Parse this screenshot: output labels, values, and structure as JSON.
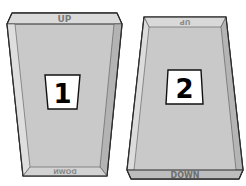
{
  "figure": {
    "colors": {
      "face": "#c8c8c8",
      "side_light": "#dcdcdc",
      "side_dark": "#b4b4b4",
      "rim": "#d6d6d6",
      "outline": "#2b2b2b",
      "label_bg": "#ffffff",
      "label_text": "#000000",
      "face_text": "#7a7a7a"
    }
  },
  "boxes": [
    {
      "id": "1",
      "number_label": "1",
      "top_text": "UP",
      "bottom_text": "DOWN",
      "bottom_text_mirrored": true,
      "top_text_mirrored": false
    },
    {
      "id": "2",
      "number_label": "2",
      "top_text": "UP",
      "bottom_text": "DOWN",
      "top_text_mirrored": true,
      "bottom_text_mirrored": false
    }
  ]
}
